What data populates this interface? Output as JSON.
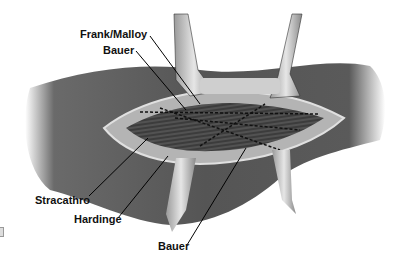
{
  "figure": {
    "colors": {
      "background": "#ffffff",
      "skin_dark": "#4a4a4a",
      "skin_mid": "#6e6e6e",
      "wound_edge": "#b8b8b8",
      "muscle": "#3a3a3a",
      "retractor": "#c8c8c8",
      "leader_line": "#000000"
    }
  },
  "labels": {
    "frank_malloy": "Frank/Malloy",
    "bauer_top": "Bauer",
    "stracathro": "Stracathro",
    "hardinge": "Hardinge",
    "bauer_bottom": "Bauer"
  }
}
